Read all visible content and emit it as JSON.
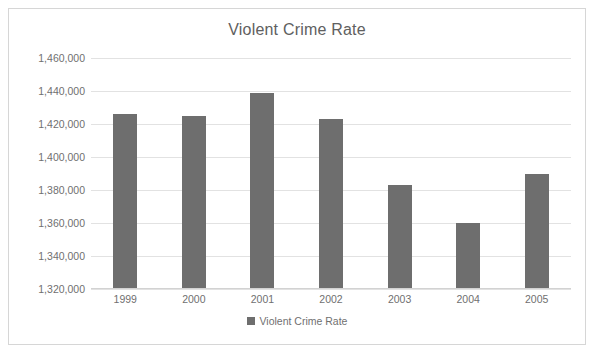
{
  "chart_data": {
    "type": "bar",
    "title": "Violent Crime Rate",
    "xlabel": "",
    "ylabel": "",
    "categories": [
      "1999",
      "2000",
      "2001",
      "2002",
      "2003",
      "2004",
      "2005"
    ],
    "values": [
      1426000,
      1425000,
      1439000,
      1423000,
      1383000,
      1360000,
      1390000
    ],
    "series": [
      {
        "name": "Violent Crime Rate",
        "values": [
          1426000,
          1425000,
          1439000,
          1423000,
          1383000,
          1360000,
          1390000
        ]
      }
    ],
    "ylim": [
      1320000,
      1460000
    ],
    "ytick_step": 20000,
    "ytick_labels": [
      "1,320,000",
      "1,340,000",
      "1,360,000",
      "1,380,000",
      "1,400,000",
      "1,420,000",
      "1,440,000",
      "1,460,000"
    ],
    "ytick_values": [
      1320000,
      1340000,
      1360000,
      1380000,
      1400000,
      1420000,
      1440000,
      1460000
    ],
    "grid": true,
    "legend_position": "bottom",
    "legend_entries": [
      "Violent Crime Rate"
    ],
    "colors": {
      "bar": "#6e6e6e",
      "gridline": "#e2e2e2",
      "text": "#707070",
      "title": "#606060",
      "border": "#d6d6d6",
      "background": "#ffffff"
    }
  },
  "legend": {
    "label": "Violent Crime Rate"
  }
}
